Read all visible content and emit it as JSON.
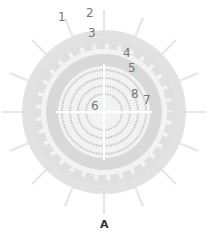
{
  "diagram": {
    "caption": "A",
    "labels": [
      {
        "text": "1",
        "x": 58,
        "y": 11
      },
      {
        "text": "2",
        "x": 86,
        "y": 7
      },
      {
        "text": "3",
        "x": 88,
        "y": 27
      },
      {
        "text": "4",
        "x": 123,
        "y": 47
      },
      {
        "text": "5",
        "x": 128,
        "y": 62
      },
      {
        "text": "6",
        "x": 91,
        "y": 100
      },
      {
        "text": "7",
        "x": 143,
        "y": 94
      },
      {
        "text": "8",
        "x": 131,
        "y": 88
      }
    ],
    "colors": {
      "outer_ring": "#e2e2e2",
      "bead_ring": "#f4f4f4",
      "mid_ring": "#d8d8d8",
      "core": "#f0f0f0",
      "strand": "#c8c8c8",
      "spike": "#e8e8e8"
    }
  }
}
